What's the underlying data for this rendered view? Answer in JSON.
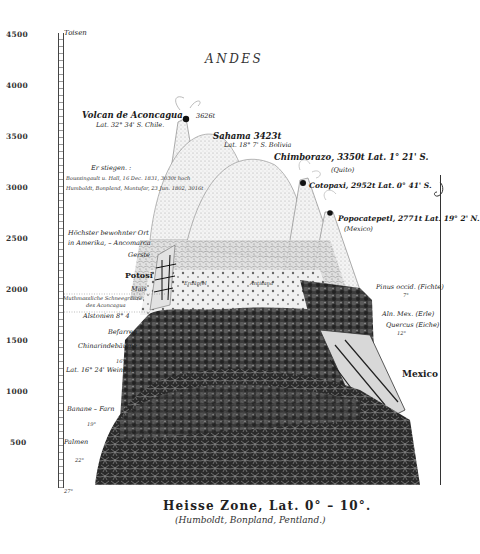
{
  "title": "ANDES",
  "axis": {
    "unit": "Toisen",
    "ticks": [
      {
        "label": "4500",
        "y": 34
      },
      {
        "label": "4000",
        "y": 85
      },
      {
        "label": "3500",
        "y": 136
      },
      {
        "label": "3000",
        "y": 187
      },
      {
        "label": "2500",
        "y": 238
      },
      {
        "label": "2000",
        "y": 289
      },
      {
        "label": "1500",
        "y": 340
      },
      {
        "label": "1000",
        "y": 391
      },
      {
        "label": "500",
        "y": 442
      }
    ]
  },
  "peaks": {
    "aconcagua": {
      "name": "Volcan de Aconcagua",
      "height": "3626t",
      "lat": "Lat. 32° 34' S. Chile."
    },
    "sahama": {
      "name": "Sahama 3423t",
      "lat": "Lat. 18° 7' S. Bolivia"
    },
    "chimborazo": {
      "name": "Chimborazo, 3350t Lat. 1° 21' S.",
      "region": "(Quito)"
    },
    "cotopaxi": {
      "name": "Cotopaxi, 2952t Lat. 0° 41' S."
    },
    "popocatepetl": {
      "name": "Popocatepetl, 2771t Lat. 19° 2' N.",
      "region": "(Mexico)"
    }
  },
  "left_labels": {
    "ersteigen": "Er stiegen. :",
    "boussingault": "Boussingault u. Hall, 16 Dec. 1831, 3030t hoch",
    "humboldt": "Humboldt, Bonpland, Montufar, 23 Jun. 1802, 3016t",
    "highest_1": "Höchster bewohnter Ort",
    "highest_2": "in Amerika, – Ancomarca",
    "gerste": "Gerste",
    "potosi": "Potosi",
    "mais": "Mais",
    "snow_1": "Muthmassliche Schneegränze",
    "snow_2": "des Aconcagua",
    "alstonien": "Alstonien 8° 4",
    "bofarren": "Befarren",
    "chinarinde": "Chinarindebäume",
    "deg16": "16°",
    "lat_weinbau": "Lat. 16° 24' Weinbau",
    "bananen": "Banane – Farn",
    "deg19": "19°",
    "palmen": "Palmen",
    "deg22": "22°",
    "deg27": "27°"
  },
  "center_labels": {
    "erdaepfel": "Erdäpfel",
    "antisana": "Antisana"
  },
  "right_labels": {
    "pinus_1": "Pinus occid. (Fichte)",
    "pinus_2": "7°",
    "alnus": "Aln. Mex. (Erle)",
    "quercus_1": "Quercus (Eiche)",
    "quercus_2": "12°",
    "mexico": "Mexico"
  },
  "caption": {
    "main": "Heisse Zone, Lat. 0° – 10°.",
    "sub": "(Humboldt, Bonpland, Pentland.)"
  },
  "colors": {
    "ink": "#1c1c1c",
    "paper": "#ffffff",
    "foliage_dark": "#2b2b2b",
    "snow_stipple": "#bdbdbd"
  }
}
